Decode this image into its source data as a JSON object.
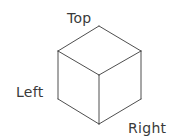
{
  "diagram": {
    "labels": {
      "top": "Top",
      "left": "Left",
      "right": "Right"
    },
    "colors": {
      "line": "#3a3a3a",
      "text": "#3a3a3a",
      "background": "#ffffff"
    },
    "vertices": {
      "top": [
        99,
        26
      ],
      "upper_left": [
        58,
        51
      ],
      "upper_right": [
        141,
        51
      ],
      "front_center": [
        99,
        75
      ],
      "lower_left": [
        58,
        99
      ],
      "lower_right": [
        141,
        99
      ],
      "bottom": [
        99,
        124
      ]
    },
    "faces": [
      "Top",
      "Left",
      "Right"
    ]
  }
}
